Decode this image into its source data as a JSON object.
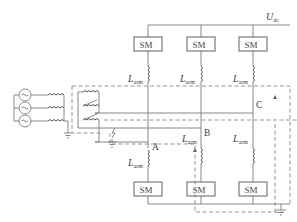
{
  "diagram": {
    "type": "MMC three-phase converter with pole-to-ground fault current path",
    "dc_voltage_label": {
      "main": "U",
      "sub": "dc"
    },
    "submodule_label": "SM",
    "arm_inductor_label": {
      "main": "L",
      "sub": "arm"
    },
    "phase_nodes": [
      "A",
      "B",
      "C"
    ],
    "upper_submodules": [
      "SM",
      "SM",
      "SM"
    ],
    "lower_submodules": [
      "SM",
      "SM",
      "SM"
    ],
    "upper_inductors": [
      "L_arm",
      "L_arm",
      "L_arm"
    ],
    "lower_inductors": [
      "L_arm",
      "L_arm",
      "L_arm"
    ],
    "ac_sources_count": 3,
    "colors": {
      "line": "#7a7a7a",
      "box_border": "#6e6e6e",
      "text": "#444444",
      "background": "#ffffff"
    }
  }
}
